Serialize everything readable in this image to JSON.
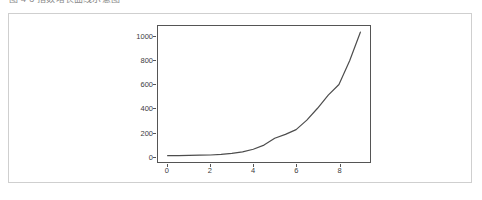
{
  "caption": {
    "text": "图 4-3 指数增长曲线示意图"
  },
  "card": {
    "border_color": "#cfcfcf",
    "background": "#ffffff"
  },
  "chart_data": {
    "type": "line",
    "title": "",
    "xlabel": "",
    "ylabel": "",
    "xlim": [
      -0.45,
      9.45
    ],
    "ylim": [
      -52,
      1092
    ],
    "grid": false,
    "legend": null,
    "line_color": "#4d4d4d",
    "line_width": 1.2,
    "axis_color": "#555555",
    "xticks": [
      0,
      2,
      4,
      6,
      8
    ],
    "xticklabels": [
      "0",
      "2",
      "4",
      "6",
      "8"
    ],
    "yticks": [
      0,
      200,
      400,
      600,
      800,
      1000
    ],
    "yticklabels": [
      "0",
      "200",
      "400",
      "600",
      "800",
      "1000"
    ],
    "series": [
      {
        "name": "exponential growth",
        "x": [
          0,
          0.5,
          1,
          1.5,
          2,
          2.5,
          3,
          3.5,
          4,
          4.5,
          5,
          5.5,
          6,
          6.5,
          7,
          7.5,
          8,
          8.5,
          9
        ],
        "y": [
          1,
          2,
          3,
          5,
          7,
          12,
          20,
          33,
          55,
          90,
          148,
          180,
          220,
          300,
          400,
          510,
          600,
          800,
          1040
        ]
      }
    ]
  }
}
